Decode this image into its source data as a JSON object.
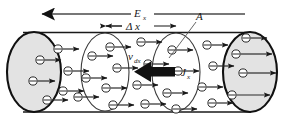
{
  "figure": {
    "name": "current-density-cylinder-diagram",
    "background_color": "#ffffff",
    "ink_color": "#1a1a1a",
    "endcap_fill": "#e3e3e3",
    "width": 283,
    "height": 120
  },
  "labels": {
    "field": {
      "symbol": "E",
      "subscript": "x",
      "text": "E x"
    },
    "length": {
      "symbol": "Δ x",
      "text": "Δ x"
    },
    "area": {
      "symbol": "A",
      "text": "A"
    },
    "drift_velocity": {
      "symbol": "v",
      "subscript": "dx",
      "text": "v dx"
    },
    "current_density": {
      "symbol": "J",
      "subscript": "x",
      "text": "J x"
    },
    "electron_symbol": "−"
  },
  "arrows": {
    "field_arrow": {
      "name": "electric-field-arrow",
      "direction": "left",
      "style": "thin-line-solid-head"
    },
    "delta_x_arrow": {
      "name": "delta-x-dimension-arrow",
      "direction": "both",
      "style": "thin-double-headed"
    },
    "current_density_arrow": {
      "name": "current-density-arrow",
      "direction": "left",
      "style": "thick-solid-block"
    },
    "electron_arrow": {
      "name": "electron-velocity-arrow",
      "direction": "right",
      "style": "thin-line-solid-head"
    }
  },
  "cylinder": {
    "name": "conductor-cylinder",
    "left_cap": {
      "name": "left-end-cap",
      "filled": true
    },
    "right_cap": {
      "name": "right-end-cap",
      "filled": true
    },
    "cross_sections": [
      {
        "name": "cross-section-1",
        "filled": false
      },
      {
        "name": "cross-section-2",
        "filled": false
      }
    ]
  },
  "electrons": [
    {
      "cx": 40,
      "cy": 60
    },
    {
      "cx": 33,
      "cy": 81
    },
    {
      "cx": 47,
      "cy": 100
    },
    {
      "cx": 58,
      "cy": 49
    },
    {
      "cx": 68,
      "cy": 71
    },
    {
      "cx": 63,
      "cy": 91
    },
    {
      "cx": 92,
      "cy": 56
    },
    {
      "cx": 86,
      "cy": 78
    },
    {
      "cx": 78,
      "cy": 97
    },
    {
      "cx": 110,
      "cy": 47
    },
    {
      "cx": 117,
      "cy": 68
    },
    {
      "cx": 106,
      "cy": 88
    },
    {
      "cx": 113,
      "cy": 105
    },
    {
      "cx": 141,
      "cy": 42
    },
    {
      "cx": 148,
      "cy": 64
    },
    {
      "cx": 137,
      "cy": 85
    },
    {
      "cx": 145,
      "cy": 104
    },
    {
      "cx": 172,
      "cy": 50
    },
    {
      "cx": 178,
      "cy": 71
    },
    {
      "cx": 167,
      "cy": 93
    },
    {
      "cx": 176,
      "cy": 109
    },
    {
      "cx": 207,
      "cy": 45
    },
    {
      "cx": 213,
      "cy": 66
    },
    {
      "cx": 202,
      "cy": 87
    },
    {
      "cx": 212,
      "cy": 103
    },
    {
      "cx": 236,
      "cy": 54
    },
    {
      "cx": 243,
      "cy": 73
    },
    {
      "cx": 232,
      "cy": 95
    },
    {
      "cx": 246,
      "cy": 38
    }
  ]
}
